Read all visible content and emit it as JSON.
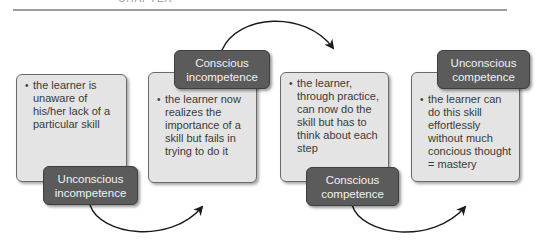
{
  "header": {
    "clipped_text": "CHAPTER"
  },
  "stages": [
    {
      "label": "Unconscious incompetence",
      "label_line1": "Unconscious",
      "label_line2": "incompetence",
      "description": "the learner is unaware of his/her lack of a particular skill",
      "bullet": "•"
    },
    {
      "label": "Conscious incompetence",
      "label_line1": "Conscious",
      "label_line2": "incompetence",
      "description": "the learner now realizes the importance of a skill but fails in trying to do it",
      "bullet": "•"
    },
    {
      "label": "Conscious competence",
      "label_line1": "Conscious",
      "label_line2": "competence",
      "description": "the learner, through practice, can now do the skill but has to think about each step",
      "bullet": "•"
    },
    {
      "label": "Unconscious competence",
      "label_line1": "Unconscious",
      "label_line2": "competence",
      "description": "the learner can do this skill effortlessly without much concious thought = mastery",
      "bullet": "•"
    }
  ],
  "arrows": [
    {
      "from": "Unconscious incompetence",
      "to": "Conscious incompetence"
    },
    {
      "from": "Conscious incompetence",
      "to": "Conscious competence"
    },
    {
      "from": "Conscious competence",
      "to": "Unconscious competence"
    }
  ],
  "colors": {
    "box_fill": "#e4e4e4",
    "box_border": "#6a6a6a",
    "label_fill": "#5b5b5b",
    "label_text": "#f2f2f2",
    "body_text": "#3a3a3a",
    "arrow": "#1a1a1a",
    "rule": "#9c9c9c"
  }
}
